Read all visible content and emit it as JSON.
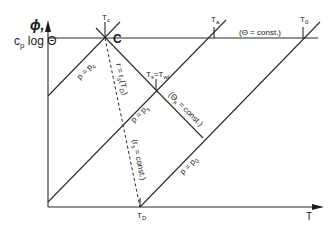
{
  "diagram": {
    "y_axis": {
      "label_line1": "ϕ,",
      "label_line2": "c",
      "label_sub": "p",
      "label_rest": " log Θ"
    },
    "x_axis": {
      "label": "T"
    },
    "points": {
      "C": {
        "label": "C",
        "tick_label": "T",
        "tick_sub": "c"
      },
      "saturation": {
        "tick_label": "T",
        "tick_sub": "s",
        "eq": "=T",
        "eq_sub": "wl"
      },
      "a": {
        "tick_label": "T",
        "tick_sub": "a"
      },
      "zero": {
        "tick_label": "T",
        "tick_sub": "0"
      },
      "dew": {
        "tick_label": "T",
        "tick_sub": "D"
      }
    },
    "annotations": {
      "theta_const": "(Θ = const.)",
      "theta_s_const": "(Θ",
      "theta_s_sub": "s",
      "theta_s_rest": " = const.)",
      "p_pc": "p = p",
      "p_pc_sub": "c",
      "p_ps": "p = p",
      "p_ps_sub": "s",
      "p_p0": "p = p",
      "p_p0_sub": "0",
      "r_rs": "r = r",
      "r_rs_sub": "s",
      "r_rs_rest": "(T",
      "r_rs_rest_sub": "D",
      "r_rs_close": ")",
      "rs_const": "(r",
      "rs_const_sub": "s",
      "rs_const_rest": " = const.)"
    }
  }
}
